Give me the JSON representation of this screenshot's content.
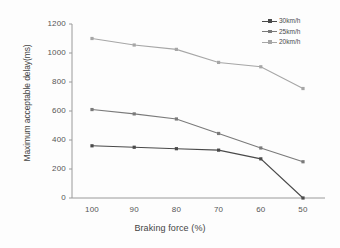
{
  "chart_data": {
    "type": "line",
    "title": "",
    "xlabel": "Braking force (%)",
    "ylabel": "Maximum acceptable delay(ms)",
    "categories": [
      "100",
      "90",
      "80",
      "70",
      "60",
      "50"
    ],
    "x": [
      100,
      90,
      80,
      70,
      60,
      50
    ],
    "xlim": [
      100,
      50
    ],
    "ylim": [
      0,
      1200
    ],
    "yticks": [
      0,
      200,
      400,
      600,
      800,
      1000,
      1200
    ],
    "xticks": [
      100,
      90,
      80,
      70,
      60,
      50
    ],
    "grid": false,
    "legend_position": "top-right",
    "series": [
      {
        "name": "30km/h",
        "values": [
          360,
          350,
          340,
          330,
          270,
          0
        ],
        "color": "#4a4a4a",
        "marker": "dot"
      },
      {
        "name": "25km/h",
        "values": [
          610,
          580,
          545,
          445,
          345,
          250
        ],
        "color": "#7a7a7a",
        "marker": "dot"
      },
      {
        "name": "20km/h",
        "values": [
          1100,
          1055,
          1025,
          935,
          905,
          755
        ],
        "color": "#a6a6a6",
        "marker": "dot"
      }
    ]
  },
  "axes": {
    "y_title": "Maximum acceptable delay(ms)",
    "x_title": "Braking force (%)",
    "y_tick_labels": [
      "1200",
      "1000",
      "800",
      "600",
      "400",
      "200",
      "0"
    ],
    "x_tick_labels": [
      "100",
      "90",
      "80",
      "70",
      "60",
      "50"
    ]
  },
  "legend": {
    "items": [
      {
        "label": "30km/h"
      },
      {
        "label": "25km/h"
      },
      {
        "label": "20km/h"
      }
    ]
  },
  "colors": {
    "axis": "#9a9a9a",
    "text": "#4a4a4a",
    "background": "#fdfdfd",
    "series_30": "#4a4a4a",
    "series_25": "#7a7a7a",
    "series_20": "#a6a6a6"
  }
}
